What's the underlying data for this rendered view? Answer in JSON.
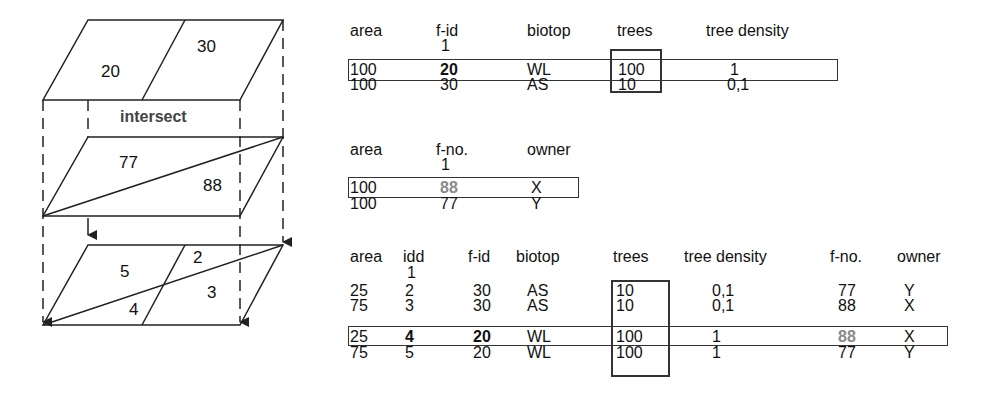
{
  "diagram": {
    "layer1": {
      "labels": [
        "20",
        "30"
      ]
    },
    "operation_label": "intersect",
    "layer2": {
      "labels": [
        "77",
        "88"
      ]
    },
    "result_layer": {
      "labels": [
        "5",
        "2",
        "4",
        "3"
      ]
    }
  },
  "table1": {
    "headers": [
      "area",
      "f-id",
      "biotop",
      "trees",
      "tree density"
    ],
    "key_marker": "1",
    "rows": [
      [
        "100",
        "20",
        "WL",
        "100",
        "1"
      ],
      [
        "100",
        "30",
        "AS",
        "10",
        "0,1"
      ]
    ]
  },
  "table2": {
    "headers": [
      "area",
      "f-no.",
      "owner"
    ],
    "key_marker": "1",
    "rows": [
      [
        "100",
        "88",
        "X"
      ],
      [
        "100",
        "77",
        "Y"
      ]
    ]
  },
  "table3": {
    "headers": [
      "area",
      "idd",
      "f-id",
      "biotop",
      "trees",
      "tree density",
      "f-no.",
      "owner"
    ],
    "key_marker": "1",
    "rows": [
      [
        "25",
        "2",
        "30",
        "AS",
        "10",
        "0,1",
        "77",
        "Y"
      ],
      [
        "75",
        "3",
        "30",
        "AS",
        "10",
        "0,1",
        "88",
        "X"
      ],
      [
        "25",
        "4",
        "20",
        "WL",
        "100",
        "1",
        "88",
        "X"
      ],
      [
        "75",
        "5",
        "20",
        "WL",
        "100",
        "1",
        "77",
        "Y"
      ]
    ]
  },
  "colors": {
    "line": "#222222",
    "highlight_gray": "#8a8a8a"
  }
}
